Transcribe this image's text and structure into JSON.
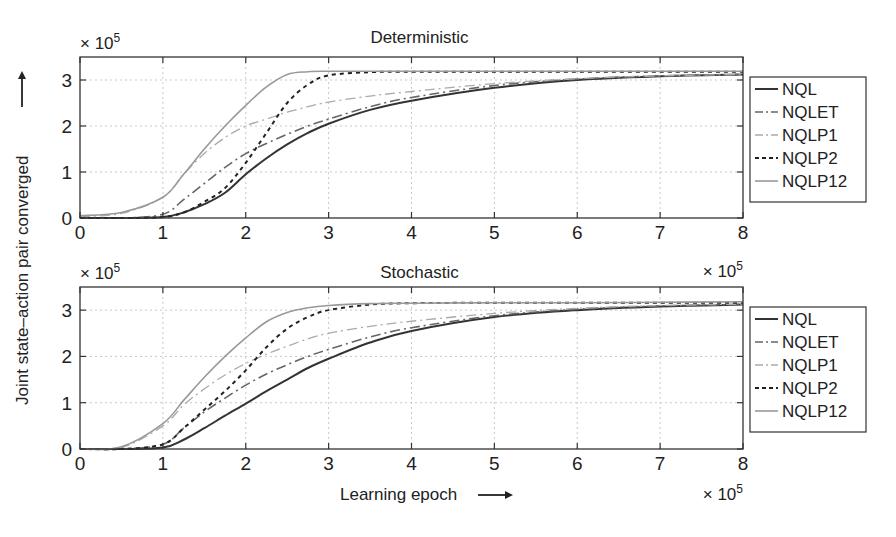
{
  "figure": {
    "ylabel": "Joint state–action pair converged",
    "xlabel": "Learning epoch",
    "x_multiplier": "× 10",
    "exponent": "5"
  },
  "chart_data": [
    {
      "type": "line",
      "title": "Deterministic",
      "xlabel": "Learning epoch",
      "ylabel": "Joint state-action pair converged",
      "x_scale": "x 10^5",
      "y_scale": "x 10^5",
      "xlim": [
        0,
        8
      ],
      "ylim": [
        0,
        3.5
      ],
      "xticks": [
        "0",
        "1",
        "2",
        "3",
        "4",
        "5",
        "6",
        "7",
        "8"
      ],
      "yticks": [
        "0",
        "1",
        "2",
        "3"
      ],
      "grid": true,
      "legend_position": "right-outside",
      "x": [
        0,
        0.5,
        1,
        1.25,
        1.5,
        1.75,
        2,
        2.25,
        2.5,
        2.75,
        3,
        3.5,
        4,
        5,
        6,
        7,
        8
      ],
      "series": [
        {
          "name": "NQL",
          "style": "solid",
          "color": "#333333",
          "values": [
            0,
            0,
            0.02,
            0.12,
            0.3,
            0.55,
            0.95,
            1.3,
            1.6,
            1.85,
            2.05,
            2.35,
            2.55,
            2.83,
            3.0,
            3.08,
            3.12
          ]
        },
        {
          "name": "NQLET",
          "style": "dashdot",
          "color": "#666666",
          "values": [
            0,
            0,
            0.08,
            0.4,
            0.75,
            1.1,
            1.4,
            1.62,
            1.82,
            2.0,
            2.15,
            2.42,
            2.62,
            2.88,
            3.02,
            3.09,
            3.12
          ]
        },
        {
          "name": "NQLP1",
          "style": "dashdot",
          "color": "#aaaaaa",
          "values": [
            0.03,
            0.1,
            0.45,
            0.95,
            1.4,
            1.75,
            2.0,
            2.15,
            2.3,
            2.42,
            2.52,
            2.65,
            2.75,
            2.92,
            3.03,
            3.09,
            3.12
          ]
        },
        {
          "name": "NQLP2",
          "style": "dotted",
          "color": "#222222",
          "values": [
            0,
            0,
            0.02,
            0.12,
            0.35,
            0.65,
            1.2,
            1.85,
            2.5,
            2.9,
            3.1,
            3.17,
            3.18,
            3.18,
            3.18,
            3.18,
            3.18
          ]
        },
        {
          "name": "NQLP12",
          "style": "solid",
          "color": "#999999",
          "values": [
            0.05,
            0.12,
            0.45,
            0.95,
            1.5,
            2.0,
            2.45,
            2.85,
            3.12,
            3.18,
            3.19,
            3.19,
            3.19,
            3.19,
            3.19,
            3.19,
            3.19
          ]
        }
      ]
    },
    {
      "type": "line",
      "title": "Stochastic",
      "xlabel": "Learning epoch",
      "ylabel": "Joint state-action pair converged",
      "x_scale": "x 10^5",
      "y_scale": "x 10^5",
      "xlim": [
        0,
        8
      ],
      "ylim": [
        0,
        3.5
      ],
      "xticks": [
        "0",
        "1",
        "2",
        "3",
        "4",
        "5",
        "6",
        "7",
        "8"
      ],
      "yticks": [
        "0",
        "1",
        "2",
        "3"
      ],
      "grid": true,
      "legend_position": "right-outside",
      "x": [
        0,
        0.5,
        1,
        1.25,
        1.5,
        1.75,
        2,
        2.25,
        2.5,
        2.75,
        3,
        3.5,
        4,
        5,
        6,
        7,
        8
      ],
      "series": [
        {
          "name": "NQL",
          "style": "solid",
          "color": "#333333",
          "values": [
            0,
            0,
            0.03,
            0.2,
            0.45,
            0.72,
            0.98,
            1.25,
            1.5,
            1.75,
            1.95,
            2.3,
            2.55,
            2.85,
            3.0,
            3.08,
            3.12
          ]
        },
        {
          "name": "NQLET",
          "style": "dashdot",
          "color": "#666666",
          "values": [
            0,
            0,
            0.1,
            0.45,
            0.8,
            1.1,
            1.38,
            1.62,
            1.82,
            2.0,
            2.15,
            2.42,
            2.62,
            2.88,
            3.02,
            3.09,
            3.12
          ]
        },
        {
          "name": "NQLP1",
          "style": "dashdot",
          "color": "#aaaaaa",
          "values": [
            0,
            0.03,
            0.5,
            0.95,
            1.3,
            1.6,
            1.85,
            2.05,
            2.22,
            2.38,
            2.5,
            2.65,
            2.76,
            2.93,
            3.04,
            3.1,
            3.13
          ]
        },
        {
          "name": "NQLP2",
          "style": "dotted",
          "color": "#222222",
          "values": [
            0,
            0,
            0.1,
            0.45,
            0.85,
            1.25,
            1.7,
            2.2,
            2.6,
            2.85,
            3.0,
            3.12,
            3.15,
            3.16,
            3.16,
            3.16,
            3.16
          ]
        },
        {
          "name": "NQLP12",
          "style": "solid",
          "color": "#999999",
          "values": [
            0,
            0.05,
            0.55,
            1.05,
            1.55,
            2.0,
            2.4,
            2.75,
            2.95,
            3.05,
            3.1,
            3.14,
            3.15,
            3.16,
            3.16,
            3.17,
            3.18
          ]
        }
      ]
    }
  ]
}
